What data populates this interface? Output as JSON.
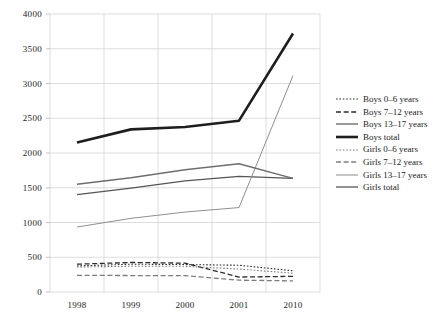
{
  "chart_data": {
    "type": "line",
    "title": "",
    "subtitle": "",
    "xlabel": "",
    "ylabel": "",
    "categories": [
      "1998",
      "1999",
      "2000",
      "2001",
      "2010"
    ],
    "x": [
      1998,
      1999,
      2000,
      2001,
      2010
    ],
    "ylim": [
      0,
      4000
    ],
    "yticks": [
      0,
      500,
      1000,
      1500,
      2000,
      2500,
      3000,
      3500,
      4000
    ],
    "ytick_labels": [
      "0",
      "500",
      "1000",
      "1500",
      "2000",
      "2500",
      "3000",
      "3500",
      "4000"
    ],
    "xtick_labels": [
      "1998",
      "1999",
      "2000",
      "2001",
      "2010"
    ],
    "grid": true,
    "grid_color": "#d4d4d4",
    "legend_position": "right",
    "series": [
      {
        "name": "Boys 0–6 years",
        "values": [
          375,
          400,
          395,
          385,
          305
        ],
        "style": "dotted",
        "color": "#2b2b2b",
        "width": 1.1
      },
      {
        "name": "Boys 7–12 years",
        "values": [
          400,
          425,
          415,
          215,
          225
        ],
        "style": "dashed",
        "color": "#2b2b2b",
        "width": 1.3
      },
      {
        "name": "Boys 13–17 years",
        "values": [
          1400,
          1495,
          1600,
          1665,
          1635
        ],
        "style": "solid",
        "color": "#555555",
        "width": 1.2
      },
      {
        "name": "Boys total",
        "values": [
          2150,
          2340,
          2375,
          2465,
          3720
        ],
        "style": "solid",
        "color": "#1e1e1e",
        "width": 2.6
      },
      {
        "name": "Girls 0–6 years",
        "values": [
          360,
          370,
          370,
          330,
          270
        ],
        "style": "dotted",
        "color": "#7d7d7d",
        "width": 1.1
      },
      {
        "name": "Girls 7–12 years",
        "values": [
          240,
          237,
          235,
          170,
          160
        ],
        "style": "dashed",
        "color": "#7d7d7d",
        "width": 1.3
      },
      {
        "name": "Girls 13–17 years",
        "values": [
          935,
          1060,
          1150,
          1215,
          3115
        ],
        "style": "solid",
        "color": "#8f8f8f",
        "width": 1.0
      },
      {
        "name": "Girls total",
        "values": [
          1550,
          1645,
          1760,
          1845,
          1635
        ],
        "style": "solid",
        "color": "#6e6e6e",
        "width": 1.5
      }
    ]
  },
  "legend": {
    "items": [
      {
        "label": "Boys 0–6 years"
      },
      {
        "label": "Boys 7–12 years"
      },
      {
        "label": "Boys 13–17 years"
      },
      {
        "label": "Boys total"
      },
      {
        "label": "Girls 0–6 years"
      },
      {
        "label": "Girls 7–12 years"
      },
      {
        "label": "Girls 13–17 years"
      },
      {
        "label": "Girls total"
      }
    ]
  }
}
